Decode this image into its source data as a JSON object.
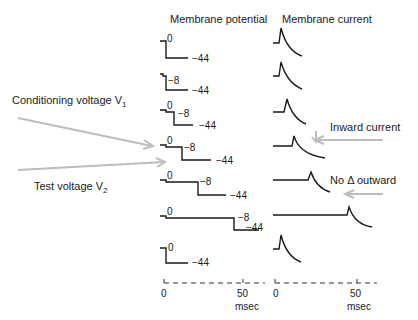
{
  "titles": {
    "potential": "Membrane potential",
    "current": "Membrane current"
  },
  "annotations": {
    "conditioning": "Conditioning voltage V",
    "conditioning_sub": "1",
    "test": "Test voltage V",
    "test_sub": "2",
    "inward": "Inward current",
    "no_outward_prefix": "No ",
    "delta": "Δ",
    "no_outward_suffix": " outward"
  },
  "axis": {
    "tick0": "0",
    "tick50": "50",
    "unit": "msec"
  },
  "traces": [
    {
      "v1": "0",
      "v2": "-44",
      "v1_label": "0",
      "v2_label": "−44",
      "conditioning_ms": 0,
      "has_v1": false
    },
    {
      "v1": "-8",
      "v2": "-44",
      "v1_label": "−8",
      "v2_label": "−44",
      "conditioning_ms": 0,
      "has_v1": false
    },
    {
      "v1": "-8",
      "v2": "-44",
      "v0_label": "0",
      "v1_label": "−8",
      "v2_label": "−44",
      "conditioning_ms": 4,
      "has_v1": true
    },
    {
      "v1": "-8",
      "v2": "-44",
      "v0_label": "0",
      "v1_label": "−8",
      "v2_label": "−44",
      "conditioning_ms": 12,
      "has_v1": true
    },
    {
      "v1": "-8",
      "v2": "-44",
      "v0_label": "0",
      "v1_label": "−8",
      "v2_label": "−44",
      "conditioning_ms": 24,
      "has_v1": true
    },
    {
      "v1": "-8",
      "v2": "-44",
      "v0_label": "0",
      "v1_label": "−8",
      "v2_label": "−44",
      "conditioning_ms": 48,
      "has_v1": true
    },
    {
      "v1": "0",
      "v2": "-44",
      "v1_label": "0",
      "v2_label": "−44",
      "conditioning_ms": 0,
      "has_v1": false
    }
  ]
}
